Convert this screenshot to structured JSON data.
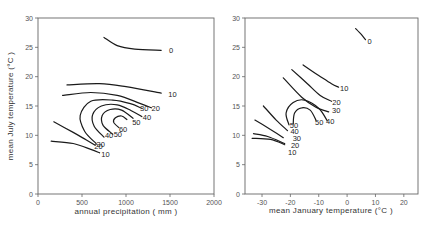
{
  "chart_data": [
    {
      "type": "contour",
      "title": "",
      "xlabel": "annual precipitation ( mm )",
      "ylabel": "mean July temperature (°C )",
      "xlim": [
        0,
        2000
      ],
      "ylim": [
        0,
        30
      ],
      "xticks": [
        0,
        500,
        1000,
        1500,
        2000
      ],
      "yticks": [
        0,
        5,
        10,
        15,
        20,
        25,
        30
      ],
      "grid": false,
      "contours": [
        {
          "level": "0",
          "points": [
            [
              750,
              26.7
            ],
            [
              900,
              25.3
            ],
            [
              1100,
              24.7
            ],
            [
              1400,
              24.5
            ]
          ],
          "label_at": [
            1490,
            24.5
          ]
        },
        {
          "level": "10",
          "points": [
            [
              330,
              18.6
            ],
            [
              700,
              18.8
            ],
            [
              1000,
              18.3
            ],
            [
              1400,
              17.2
            ]
          ],
          "label_at": [
            1480,
            17.0
          ]
        },
        {
          "level": "10",
          "points": [
            [
              150,
              9.0
            ],
            [
              400,
              8.6
            ],
            [
              600,
              7.6
            ],
            [
              700,
              7.0
            ]
          ],
          "label_at": [
            720,
            6.9
          ]
        },
        {
          "level": "20",
          "points": [
            [
              280,
              16.8
            ],
            [
              600,
              17.3
            ],
            [
              900,
              16.8
            ],
            [
              1150,
              15.5
            ],
            [
              1290,
              14.7
            ]
          ],
          "label_at": [
            1290,
            14.7
          ]
        },
        {
          "level": "20",
          "points": [
            [
              180,
              12.3
            ],
            [
              400,
              10.5
            ],
            [
              550,
              9.2
            ],
            [
              650,
              8.3
            ]
          ],
          "label_at": [
            640,
            8.2
          ]
        },
        {
          "level": "30",
          "points": [
            [
              660,
              8.6
            ],
            [
              530,
              10.7
            ],
            [
              480,
              13.4
            ],
            [
              600,
              15.8
            ],
            [
              850,
              16.0
            ],
            [
              1050,
              15.4
            ],
            [
              1180,
              14.6
            ]
          ],
          "label_at": [
            1160,
            14.7
          ]
        },
        {
          "level": "40",
          "points": [
            [
              750,
              9.7
            ],
            [
              640,
              11.5
            ],
            [
              620,
              13.5
            ],
            [
              720,
              15.0
            ],
            [
              900,
              15.2
            ],
            [
              1060,
              14.2
            ],
            [
              1180,
              13.2
            ]
          ],
          "label_at": [
            1190,
            13.1
          ]
        },
        {
          "level": "50",
          "points": [
            [
              850,
              10.2
            ],
            [
              740,
              11.7
            ],
            [
              730,
              13.4
            ],
            [
              820,
              14.4
            ],
            [
              950,
              14.3
            ],
            [
              1080,
              12.9
            ]
          ],
          "label_at": [
            1070,
            12.3
          ]
        },
        {
          "level": "60",
          "points": [
            [
              920,
              11.3
            ],
            [
              860,
              12.2
            ],
            [
              880,
              13.0
            ],
            [
              950,
              13.3
            ],
            [
              1010,
              12.7
            ]
          ],
          "label_at": [
            920,
            11.0
          ]
        },
        {
          "level": "40",
          "points": [],
          "label_at": [
            760,
            10.0
          ]
        },
        {
          "level": "50",
          "points": [],
          "label_at": [
            860,
            10.2
          ]
        },
        {
          "level": "30",
          "points": [],
          "label_at": [
            665,
            8.6
          ]
        }
      ]
    },
    {
      "type": "contour",
      "title": "",
      "xlabel": "mean January temperature (°C )",
      "ylabel": "",
      "xlim": [
        -36,
        25
      ],
      "ylim": [
        0,
        30
      ],
      "xticks": [
        -30,
        -20,
        -10,
        0,
        10,
        20
      ],
      "yticks": [
        0,
        5,
        10,
        15,
        20,
        25,
        30
      ],
      "grid": false,
      "contours": [
        {
          "level": "0",
          "points": [
            [
              3,
              28.2
            ],
            [
              5,
              27.2
            ],
            [
              6.5,
              26.3
            ]
          ],
          "label_at": [
            7.2,
            26.0
          ]
        },
        {
          "level": "10",
          "points": [
            [
              -15.5,
              22.0
            ],
            [
              -10,
              20.2
            ],
            [
              -5.5,
              18.8
            ],
            [
              -3,
              18.2
            ]
          ],
          "label_at": [
            -2.5,
            18.0
          ]
        },
        {
          "level": "20",
          "points": [
            [
              -19.5,
              21.2
            ],
            [
              -14,
              18.8
            ],
            [
              -9.5,
              16.8
            ],
            [
              -5.5,
              15.8
            ]
          ],
          "label_at": [
            -5.2,
            15.6
          ]
        },
        {
          "level": "30",
          "points": [
            [
              -22.5,
              19.8
            ],
            [
              -16,
              16.5
            ],
            [
              -11,
              14.8
            ],
            [
              -6.5,
              14.0
            ]
          ],
          "label_at": [
            -5.3,
            14.3
          ]
        },
        {
          "level": "40",
          "points": [
            [
              -7,
              12.5
            ],
            [
              -10,
              14.6
            ],
            [
              -15,
              16.0
            ],
            [
              -19,
              15.6
            ],
            [
              -21.5,
              13.8
            ],
            [
              -20.5,
              11.8
            ]
          ],
          "label_at": [
            -7.4,
            12.5
          ]
        },
        {
          "level": "50",
          "points": [
            [
              -11,
              12.6
            ],
            [
              -13,
              14.3
            ],
            [
              -16,
              14.7
            ],
            [
              -18.5,
              13.8
            ],
            [
              -19,
              11.9
            ]
          ],
          "label_at": [
            -11.3,
            12.2
          ]
        },
        {
          "level": "50",
          "points": [],
          "label_at": [
            -20.2,
            11.8
          ]
        },
        {
          "level": "40",
          "points": [
            [
              -29.5,
              15.0
            ],
            [
              -25,
              12.6
            ],
            [
              -21,
              10.8
            ]
          ],
          "label_at": [
            -20,
            10.7
          ]
        },
        {
          "level": "30",
          "points": [
            [
              -32.5,
              12.6
            ],
            [
              -27,
              11.0
            ],
            [
              -22.5,
              9.6
            ]
          ],
          "label_at": [
            -19.2,
            9.5
          ]
        },
        {
          "level": "20",
          "points": [
            [
              -33,
              10.3
            ],
            [
              -28,
              9.8
            ],
            [
              -22,
              8.6
            ]
          ],
          "label_at": [
            -19.8,
            8.3
          ]
        },
        {
          "level": "10",
          "points": [
            [
              -33.5,
              9.5
            ],
            [
              -27,
              9.3
            ],
            [
              -22,
              8.4
            ]
          ],
          "label_at": [
            -20.8,
            7.2
          ]
        }
      ]
    }
  ],
  "panels": {
    "left": {
      "xlabel": "annual precipitation ( mm )",
      "ylabel": "mean July temperature (°C )",
      "xtick_labels": [
        "0",
        "500",
        "1000",
        "1500",
        "2000"
      ],
      "ytick_labels": [
        "0",
        "5",
        "10",
        "15",
        "20",
        "25",
        "30"
      ]
    },
    "right": {
      "xlabel": "mean January temperature (°C )",
      "xtick_labels": [
        "-30",
        "-20",
        "-10",
        "0",
        "10",
        "20"
      ],
      "ytick_labels": [
        "0",
        "5",
        "10",
        "15",
        "20",
        "25",
        "30"
      ]
    }
  }
}
